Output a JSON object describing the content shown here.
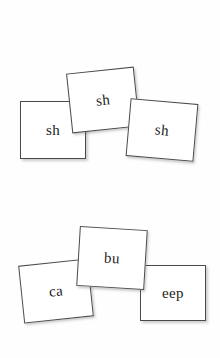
{
  "page": {
    "background_color": "#fefefe",
    "card_face_color": "#ffffff",
    "card_border_color": "#4a4a4a",
    "text_color": "#1b1b1b"
  },
  "groups": [
    {
      "name": "top-row",
      "cards": [
        {
          "id": "sh-left",
          "label": "sh",
          "rotation_deg": 0
        },
        {
          "id": "sh-middle",
          "label": "sh",
          "rotation_deg": -6
        },
        {
          "id": "sh-right",
          "label": "sh",
          "rotation_deg": 5
        }
      ]
    },
    {
      "name": "bottom-row",
      "cards": [
        {
          "id": "ca",
          "label": "ca",
          "rotation_deg": -6
        },
        {
          "id": "bu",
          "label": "bu",
          "rotation_deg": 3.5
        },
        {
          "id": "eep",
          "label": "eep",
          "rotation_deg": 0
        }
      ]
    }
  ]
}
